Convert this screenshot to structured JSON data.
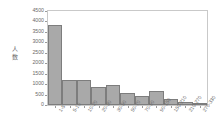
{
  "chart_data": {
    "type": "bar",
    "title": "",
    "subtitle": "",
    "xlabel": "",
    "ylabel": "人数",
    "ylim": [
      0,
      4500
    ],
    "grid": false,
    "legend": null,
    "y_ticks": [
      0,
      500,
      1000,
      1500,
      2000,
      2500,
      3000,
      3500,
      4000,
      4500
    ],
    "y_tick_labels": [
      "0",
      "500",
      "1000",
      "1500",
      "2000",
      "2500",
      "3000",
      "3500",
      "4000",
      "4500"
    ],
    "categories": [
      "1-5",
      "5-10",
      "10-20",
      "20-30",
      "30-50",
      "50-70",
      "70-90",
      "90-150",
      "150-210",
      "210-270",
      "270-330"
    ],
    "values": [
      3850,
      1200,
      1210,
      870,
      960,
      580,
      430,
      650,
      310,
      140,
      40
    ],
    "bar_color": "#a9a9a9",
    "bar_edge_color": "#7d7d7d",
    "plot_background": "#ffffff",
    "frame_color": "#c9c9c9",
    "text_color": "#6a6a6a"
  }
}
